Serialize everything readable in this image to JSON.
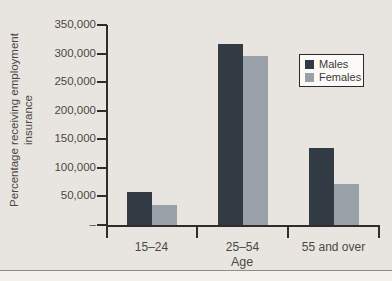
{
  "page": {
    "background_color": "#e8e5e0",
    "footer_background_color": "#f3f1ec",
    "divider_color": "#8f8d88",
    "axis_color": "#2e2d2b",
    "text_color": "#4b4843"
  },
  "chart_data": {
    "type": "bar",
    "title": "",
    "categories": [
      "15–24",
      "25–54",
      "55 and over"
    ],
    "series": [
      {
        "name": "Males",
        "color": "#323a43",
        "values": [
          58000,
          317000,
          135000
        ]
      },
      {
        "name": "Females",
        "color": "#99a1a8",
        "values": [
          35000,
          296000,
          71000
        ]
      }
    ],
    "xlabel": "Age",
    "ylabel": "Percentage receiving employment insurance",
    "ylabel_line1": "Percentage receiving employment",
    "ylabel_line2": "insurance",
    "ylim": [
      0,
      350000
    ],
    "ytick_interval": 50000,
    "yticks": [
      {
        "value": 350000,
        "label": "350,000"
      },
      {
        "value": 300000,
        "label": "300,000"
      },
      {
        "value": 250000,
        "label": "250,000"
      },
      {
        "value": 200000,
        "label": "200,000"
      },
      {
        "value": 150000,
        "label": "150,000"
      },
      {
        "value": 100000,
        "label": "100,000"
      },
      {
        "value": 50000,
        "label": "50,000"
      },
      {
        "value": 0,
        "label": "–"
      }
    ],
    "legend": {
      "position": "upper-right",
      "entries": [
        "Males",
        "Females"
      ]
    },
    "grid": false
  }
}
